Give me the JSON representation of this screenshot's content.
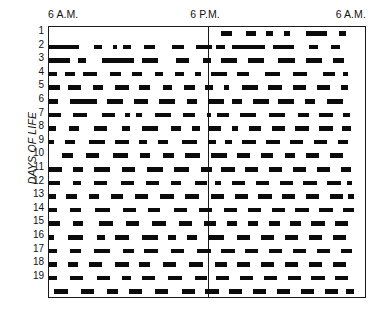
{
  "figure": {
    "type": "actogram",
    "axis": {
      "y_title": "DAYS OF LIFE",
      "time_labels": [
        "6 A.M.",
        "6 P.M.",
        "6 A.M."
      ],
      "day_labels": [
        "1",
        "2",
        "3",
        "4",
        "5",
        "6",
        "7",
        "8",
        "9",
        "10",
        "11",
        "12",
        "13",
        "14",
        "15",
        "16",
        "17",
        "18",
        "19"
      ]
    },
    "colors": {
      "ink": "#0b0b0b",
      "frame": "#1a1a1a",
      "background": "#ffffff"
    }
  },
  "chart_data": {
    "type": "heatmap",
    "title": "",
    "subtitle": "",
    "xlabel": "",
    "ylabel": "DAYS OF LIFE",
    "grid": false,
    "legend": "none",
    "x_tick_labels": [
      "6 A.M.",
      "6 P.M.",
      "6 A.M."
    ],
    "x_tick_hours": [
      6,
      18,
      30
    ],
    "xlim_hours": [
      6,
      30
    ],
    "midline_hour": 18,
    "y_tick_labels": [
      "1",
      "2",
      "3",
      "4",
      "5",
      "6",
      "7",
      "8",
      "9",
      "10",
      "11",
      "12",
      "13",
      "14",
      "15",
      "16",
      "17",
      "18",
      "19"
    ],
    "ylim_days": [
      1,
      20
    ],
    "units": "hours of clock time; each black bar is an episode of activity/feeding",
    "rows": [
      {
        "day": "1",
        "bouts": [
          [
            19.0,
            19.8
          ],
          [
            20.9,
            21.6
          ],
          [
            22.4,
            22.9
          ],
          [
            23.7,
            24.2
          ],
          [
            25.4,
            27.0
          ],
          [
            27.9,
            28.4
          ]
        ]
      },
      {
        "day": "2",
        "bouts": [
          [
            6.0,
            8.3
          ],
          [
            9.4,
            10.0
          ],
          [
            10.8,
            11.1
          ],
          [
            11.6,
            12.2
          ],
          [
            13.2,
            14.0
          ],
          [
            15.3,
            16.2
          ],
          [
            17.1,
            18.3
          ],
          [
            18.6,
            19.3
          ],
          [
            19.8,
            22.3
          ],
          [
            22.9,
            24.5
          ],
          [
            25.6,
            26.3
          ],
          [
            27.3,
            28.0
          ]
        ]
      },
      {
        "day": "3",
        "bouts": [
          [
            6.0,
            7.6
          ],
          [
            8.2,
            8.8
          ],
          [
            10.0,
            12.4
          ],
          [
            13.0,
            14.2
          ],
          [
            15.6,
            16.6
          ],
          [
            17.6,
            18.2
          ],
          [
            19.0,
            20.2
          ],
          [
            21.0,
            22.2
          ],
          [
            23.3,
            24.6
          ],
          [
            25.4,
            26.6
          ],
          [
            27.4,
            28.3
          ]
        ]
      },
      {
        "day": "4",
        "bouts": [
          [
            6.0,
            6.6
          ],
          [
            7.2,
            8.0
          ],
          [
            8.6,
            9.6
          ],
          [
            10.6,
            11.4
          ],
          [
            12.3,
            13.0
          ],
          [
            14.0,
            14.6
          ],
          [
            15.5,
            16.2
          ],
          [
            17.0,
            17.5
          ],
          [
            18.2,
            19.4
          ],
          [
            20.2,
            21.1
          ],
          [
            22.3,
            23.4
          ],
          [
            24.4,
            25.5
          ],
          [
            26.7,
            27.6
          ],
          [
            28.2,
            28.6
          ]
        ]
      },
      {
        "day": "5",
        "bouts": [
          [
            6.0,
            6.8
          ],
          [
            7.4,
            8.4
          ],
          [
            9.3,
            10.1
          ],
          [
            11.0,
            12.0
          ],
          [
            12.8,
            13.6
          ],
          [
            14.6,
            15.3
          ],
          [
            16.2,
            17.0
          ],
          [
            17.8,
            18.4
          ],
          [
            19.2,
            19.6
          ],
          [
            20.6,
            21.8
          ],
          [
            22.5,
            23.6
          ],
          [
            24.4,
            25.4
          ],
          [
            26.2,
            27.2
          ],
          [
            28.0,
            28.6
          ]
        ]
      },
      {
        "day": "6",
        "bouts": [
          [
            6.0,
            6.7
          ],
          [
            7.6,
            9.6
          ],
          [
            10.4,
            11.6
          ],
          [
            12.4,
            13.5
          ],
          [
            14.3,
            15.5
          ],
          [
            16.4,
            17.2
          ],
          [
            18.0,
            19.2
          ],
          [
            19.8,
            20.6
          ],
          [
            21.4,
            22.6
          ],
          [
            23.3,
            24.5
          ],
          [
            25.3,
            26.1
          ],
          [
            27.0,
            28.2
          ]
        ]
      },
      {
        "day": "7",
        "bouts": [
          [
            6.0,
            6.9
          ],
          [
            7.8,
            8.9
          ],
          [
            10.0,
            11.0
          ],
          [
            11.7,
            12.1
          ],
          [
            12.6,
            13.0
          ],
          [
            14.0,
            15.2
          ],
          [
            16.1,
            17.0
          ],
          [
            17.9,
            18.2
          ],
          [
            18.7,
            19.6
          ],
          [
            20.4,
            21.6
          ],
          [
            22.6,
            23.8
          ],
          [
            24.8,
            25.6
          ],
          [
            26.4,
            27.4
          ],
          [
            28.2,
            28.7
          ]
        ]
      },
      {
        "day": "8",
        "bouts": [
          [
            6.0,
            6.5
          ],
          [
            7.5,
            8.3
          ],
          [
            9.4,
            10.4
          ],
          [
            11.5,
            12.1
          ],
          [
            13.0,
            14.2
          ],
          [
            15.2,
            16.0
          ],
          [
            16.8,
            17.4
          ],
          [
            18.1,
            19.0
          ],
          [
            19.8,
            20.3
          ],
          [
            21.1,
            22.0
          ],
          [
            22.8,
            23.8
          ],
          [
            24.6,
            25.6
          ],
          [
            26.4,
            27.4
          ],
          [
            28.1,
            28.8
          ]
        ]
      },
      {
        "day": "9",
        "bouts": [
          [
            6.0,
            6.4
          ],
          [
            7.2,
            8.0
          ],
          [
            9.0,
            10.2
          ],
          [
            11.0,
            12.0
          ],
          [
            12.8,
            13.4
          ],
          [
            14.2,
            15.0
          ],
          [
            16.0,
            17.2
          ],
          [
            18.0,
            18.6
          ],
          [
            19.3,
            19.8
          ],
          [
            20.6,
            21.6
          ],
          [
            22.4,
            23.4
          ],
          [
            24.2,
            25.2
          ],
          [
            26.0,
            27.0
          ],
          [
            27.8,
            28.6
          ]
        ]
      },
      {
        "day": "10",
        "bouts": [
          [
            7.0,
            7.8
          ],
          [
            8.8,
            9.8
          ],
          [
            10.8,
            12.0
          ],
          [
            12.9,
            13.6
          ],
          [
            14.6,
            15.4
          ],
          [
            16.3,
            17.4
          ],
          [
            18.2,
            19.4
          ],
          [
            20.2,
            21.2
          ],
          [
            22.0,
            22.9
          ],
          [
            23.8,
            24.6
          ],
          [
            25.4,
            26.4
          ],
          [
            27.2,
            28.2
          ]
        ]
      },
      {
        "day": "11",
        "bouts": [
          [
            6.0,
            7.0
          ],
          [
            7.8,
            8.6
          ],
          [
            9.4,
            10.6
          ],
          [
            11.5,
            12.5
          ],
          [
            13.4,
            14.6
          ],
          [
            15.4,
            16.6
          ],
          [
            17.5,
            18.3
          ],
          [
            19.0,
            20.0
          ],
          [
            20.8,
            21.8
          ],
          [
            22.6,
            23.6
          ],
          [
            24.4,
            25.4
          ],
          [
            26.2,
            27.2
          ],
          [
            28.0,
            28.8
          ]
        ]
      },
      {
        "day": "12",
        "bouts": [
          [
            6.0,
            6.8
          ],
          [
            7.8,
            8.4
          ],
          [
            9.4,
            10.4
          ],
          [
            11.4,
            12.4
          ],
          [
            13.3,
            14.3
          ],
          [
            15.2,
            16.0
          ],
          [
            17.0,
            17.9
          ],
          [
            18.5,
            19.0
          ],
          [
            19.8,
            20.8
          ],
          [
            21.6,
            22.6
          ],
          [
            23.4,
            24.4
          ],
          [
            25.2,
            26.2
          ],
          [
            27.0,
            28.0
          ],
          [
            28.5,
            28.9
          ]
        ]
      },
      {
        "day": "13",
        "bouts": [
          [
            6.0,
            6.5
          ],
          [
            7.3,
            8.1
          ],
          [
            9.0,
            9.8
          ],
          [
            10.7,
            11.6
          ],
          [
            12.5,
            13.5
          ],
          [
            14.4,
            15.4
          ],
          [
            16.3,
            17.3
          ],
          [
            18.2,
            19.2
          ],
          [
            20.0,
            21.0
          ],
          [
            21.8,
            22.8
          ],
          [
            23.6,
            24.6
          ],
          [
            25.4,
            26.4
          ],
          [
            27.2,
            28.2
          ],
          [
            28.6,
            29.0
          ]
        ]
      },
      {
        "day": "14",
        "bouts": [
          [
            6.0,
            6.6
          ],
          [
            7.6,
            8.4
          ],
          [
            9.5,
            10.6
          ],
          [
            11.6,
            12.6
          ],
          [
            13.5,
            14.4
          ],
          [
            15.4,
            16.4
          ],
          [
            17.3,
            18.3
          ],
          [
            19.2,
            20.2
          ],
          [
            21.0,
            22.0
          ],
          [
            22.8,
            23.8
          ],
          [
            24.6,
            25.6
          ],
          [
            26.4,
            27.4
          ],
          [
            28.2,
            29.0
          ]
        ]
      },
      {
        "day": "15",
        "bouts": [
          [
            6.0,
            6.8
          ],
          [
            7.8,
            8.6
          ],
          [
            9.8,
            10.8
          ],
          [
            11.8,
            12.8
          ],
          [
            13.8,
            14.8
          ],
          [
            15.8,
            16.8
          ],
          [
            17.7,
            18.6
          ],
          [
            19.4,
            20.2
          ],
          [
            21.0,
            21.8
          ],
          [
            22.6,
            23.4
          ],
          [
            24.2,
            25.0
          ],
          [
            25.8,
            26.8
          ],
          [
            27.6,
            28.6
          ]
        ]
      },
      {
        "day": "16",
        "bouts": [
          [
            6.0,
            6.4
          ],
          [
            7.4,
            8.6
          ],
          [
            9.6,
            10.2
          ],
          [
            11.0,
            12.0
          ],
          [
            13.0,
            14.2
          ],
          [
            15.0,
            15.6
          ],
          [
            16.4,
            17.2
          ],
          [
            18.0,
            19.2
          ],
          [
            20.2,
            21.2
          ],
          [
            22.0,
            23.0
          ],
          [
            23.8,
            24.8
          ],
          [
            25.6,
            26.6
          ],
          [
            27.4,
            28.4
          ]
        ]
      },
      {
        "day": "17",
        "bouts": [
          [
            6.0,
            6.6
          ],
          [
            7.6,
            8.4
          ],
          [
            9.4,
            10.6
          ],
          [
            11.6,
            12.4
          ],
          [
            13.2,
            14.2
          ],
          [
            15.2,
            16.2
          ],
          [
            17.2,
            18.2
          ],
          [
            19.0,
            20.0
          ],
          [
            20.8,
            21.8
          ],
          [
            22.6,
            23.6
          ],
          [
            24.4,
            25.4
          ],
          [
            26.2,
            27.2
          ],
          [
            28.0,
            28.9
          ]
        ]
      },
      {
        "day": "18",
        "bouts": [
          [
            6.0,
            6.6
          ],
          [
            7.4,
            8.2
          ],
          [
            9.0,
            10.0
          ],
          [
            11.0,
            12.0
          ],
          [
            12.8,
            13.6
          ],
          [
            14.6,
            15.6
          ],
          [
            16.6,
            17.6
          ],
          [
            18.5,
            19.4
          ],
          [
            20.2,
            21.2
          ],
          [
            22.0,
            23.0
          ],
          [
            23.8,
            24.8
          ],
          [
            25.6,
            26.6
          ],
          [
            27.4,
            28.4
          ]
        ]
      },
      {
        "day": "19",
        "bouts": [
          [
            6.0,
            6.6
          ],
          [
            7.6,
            8.6
          ],
          [
            9.6,
            10.6
          ],
          [
            11.5,
            12.2
          ],
          [
            13.0,
            14.0
          ],
          [
            15.0,
            16.0
          ],
          [
            17.0,
            17.9
          ],
          [
            18.6,
            19.6
          ],
          [
            20.4,
            21.4
          ],
          [
            22.2,
            23.2
          ],
          [
            24.0,
            25.0
          ],
          [
            25.8,
            26.8
          ],
          [
            27.6,
            28.6
          ]
        ]
      },
      {
        "day": "20",
        "bouts": [
          [
            6.4,
            7.4
          ],
          [
            8.4,
            9.4
          ],
          [
            10.4,
            11.2
          ],
          [
            12.0,
            13.0
          ],
          [
            14.0,
            15.0
          ],
          [
            16.0,
            17.0
          ],
          [
            17.8,
            18.8
          ],
          [
            19.6,
            20.6
          ],
          [
            21.4,
            22.4
          ],
          [
            23.2,
            24.2
          ],
          [
            25.0,
            26.0
          ],
          [
            26.8,
            27.8
          ],
          [
            28.4,
            29.0
          ]
        ]
      }
    ]
  }
}
